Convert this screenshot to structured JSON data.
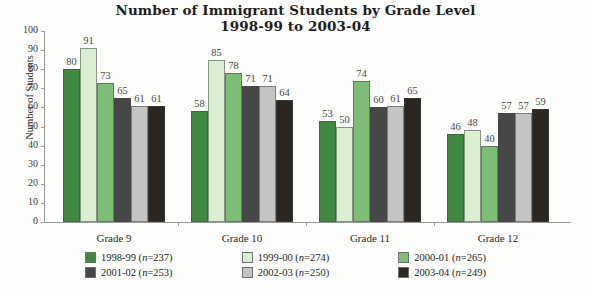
{
  "title": {
    "line1": "Number of Immigrant Students by Grade Level",
    "line2": "1998-99 to 2003-04"
  },
  "axis": {
    "ylabel": "Number of Students",
    "yticks": [
      "0",
      "10",
      "20",
      "30",
      "40",
      "50",
      "60",
      "70",
      "80",
      "90",
      "100"
    ]
  },
  "legend": [
    {
      "label": "1998-99 (n=237)",
      "year": "1998-99",
      "n": "n=237",
      "color": "#3f8a3f"
    },
    {
      "label": "1999-00 (n=274)",
      "year": "1999-00",
      "n": "n=274",
      "color": "#d9efd2"
    },
    {
      "label": "2000-01 (n=265)",
      "year": "2000-01",
      "n": "n=265",
      "color": "#7dbd74"
    },
    {
      "label": "2001-02 (n=253)",
      "year": "2001-02",
      "n": "n=253",
      "color": "#474747"
    },
    {
      "label": "2002-03 (n=250)",
      "year": "2002-03",
      "n": "n=250",
      "color": "#c4c4c4"
    },
    {
      "label": "2003-04 (n=249)",
      "year": "2003-04",
      "n": "n=249",
      "color": "#2b2622"
    }
  ],
  "chart_data": {
    "type": "bar",
    "title": "Number of Immigrant Students by Grade Level 1998-99 to 2003-04",
    "xlabel": "",
    "ylabel": "Number of Students",
    "ylim": [
      0,
      100
    ],
    "ytick_step": 10,
    "grid": false,
    "legend_position": "bottom",
    "categories": [
      "Grade 9",
      "Grade 10",
      "Grade 11",
      "Grade 12"
    ],
    "series": [
      {
        "name": "1998-99 (n=237)",
        "color": "#3f8a3f",
        "values": [
          80,
          58,
          53,
          46
        ]
      },
      {
        "name": "1999-00 (n=274)",
        "color": "#d9efd2",
        "values": [
          91,
          85,
          50,
          48
        ]
      },
      {
        "name": "2000-01 (n=265)",
        "color": "#7dbd74",
        "values": [
          73,
          78,
          74,
          40
        ]
      },
      {
        "name": "2001-02 (n=253)",
        "color": "#474747",
        "values": [
          65,
          71,
          60,
          57
        ]
      },
      {
        "name": "2002-03 (n=250)",
        "color": "#c4c4c4",
        "values": [
          61,
          71,
          61,
          57
        ]
      },
      {
        "name": "2003-04 (n=249)",
        "color": "#2b2622",
        "values": [
          61,
          64,
          65,
          59
        ]
      }
    ]
  }
}
